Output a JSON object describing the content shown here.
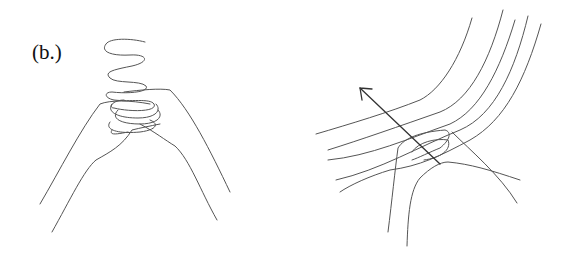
{
  "figure": {
    "label": "(b.)",
    "panels": [
      {
        "name": "left",
        "description": "two hands grasping a coiled wavy spring-like strand"
      },
      {
        "name": "right",
        "description": "hand pinching a bundle of curved lines with an arrow pointing up-left"
      }
    ],
    "colors": {
      "background": "#ffffff",
      "line": "#555555"
    }
  }
}
